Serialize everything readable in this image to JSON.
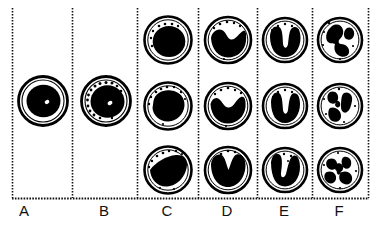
{
  "figure": {
    "background_color": "#ffffff",
    "ink_color": "#000000",
    "width": 373,
    "height": 226
  },
  "axis": {
    "baseline_y": 198,
    "style": "dotted",
    "divider_style": "dotted",
    "divider_x": [
      12,
      72,
      137,
      198,
      257,
      312,
      368
    ],
    "top_y": 8
  },
  "columns": [
    {
      "id": "A",
      "label": "A",
      "label_x": 24,
      "stage_name": "myeloblast",
      "cell_count": 1,
      "cells": [
        {
          "row": "middle",
          "cx": 43,
          "cy": 101,
          "r": 25,
          "membrane_width": 2.6,
          "nucleus": "round-large",
          "nucleus_r": 17,
          "nucleolus": true,
          "granules": 0
        }
      ]
    },
    {
      "id": "B",
      "label": "B",
      "label_x": 104,
      "stage_name": "promyelocyte",
      "cell_count": 1,
      "cells": [
        {
          "row": "middle",
          "cx": 106,
          "cy": 101,
          "r": 25,
          "membrane_width": 2.6,
          "nucleus": "round-large",
          "nucleus_r": 17,
          "nucleolus": true,
          "granules": 14
        }
      ]
    },
    {
      "id": "C",
      "label": "C",
      "label_x": 167,
      "stage_name": "myelocyte",
      "cell_count": 3,
      "cells": [
        {
          "row": "top",
          "cx": 168,
          "cy": 40,
          "r": 24,
          "nucleus": "round",
          "granules": 7
        },
        {
          "row": "middle",
          "cx": 168,
          "cy": 106,
          "r": 24,
          "nucleus": "oval-offset",
          "granules": 9
        },
        {
          "row": "bottom",
          "cx": 168,
          "cy": 170,
          "r": 24,
          "nucleus": "flattened-lower",
          "granules": 9
        }
      ]
    },
    {
      "id": "D",
      "label": "D",
      "label_x": 227,
      "stage_name": "metamyelocyte",
      "cell_count": 3,
      "cells": [
        {
          "row": "top",
          "cx": 228,
          "cy": 40,
          "r": 23,
          "nucleus": "indented",
          "granules": 6
        },
        {
          "row": "middle",
          "cx": 228,
          "cy": 106,
          "r": 23,
          "nucleus": "kidney",
          "granules": 6
        },
        {
          "row": "bottom",
          "cx": 228,
          "cy": 170,
          "r": 23,
          "nucleus": "deep-indented",
          "granules": 5
        }
      ]
    },
    {
      "id": "E",
      "label": "E",
      "label_x": 284,
      "stage_name": "band cell",
      "cell_count": 3,
      "cells": [
        {
          "row": "top",
          "cx": 285,
          "cy": 40,
          "r": 22,
          "nucleus": "horseshoe",
          "granules": 5
        },
        {
          "row": "middle",
          "cx": 285,
          "cy": 106,
          "r": 22,
          "nucleus": "u-shaped",
          "granules": 5
        },
        {
          "row": "bottom",
          "cx": 285,
          "cy": 170,
          "r": 22,
          "nucleus": "v-shaped",
          "granules": 6
        }
      ]
    },
    {
      "id": "F",
      "label": "F",
      "label_x": 339,
      "stage_name": "segmented neutrophil",
      "cell_count": 3,
      "cells": [
        {
          "row": "top",
          "cx": 340,
          "cy": 40,
          "r": 22,
          "nucleus": "two-lobed",
          "lobes": 2,
          "granules": 5
        },
        {
          "row": "middle",
          "cx": 340,
          "cy": 106,
          "r": 22,
          "nucleus": "three-lobed",
          "lobes": 3,
          "granules": 5
        },
        {
          "row": "bottom",
          "cx": 340,
          "cy": 170,
          "r": 22,
          "nucleus": "four-lobed",
          "lobes": 4,
          "granules": 4
        }
      ]
    }
  ],
  "labels": {
    "a": "A",
    "b": "B",
    "c": "C",
    "d": "D",
    "e": "E",
    "f": "F"
  }
}
